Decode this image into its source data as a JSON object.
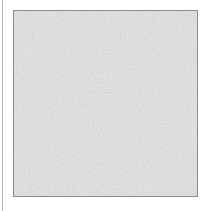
{
  "image": {
    "content_name": "gray-speckled-noise-texture",
    "text": ""
  },
  "colors": {
    "page_background": "#ffffff",
    "left_rule": "#b4b4b4",
    "frame_border": "#8c8c8c",
    "texture_base": "#b9b9b9",
    "texture_dark_grain": "#9e9e9e",
    "texture_light_grain": "#d2d2d2"
  }
}
